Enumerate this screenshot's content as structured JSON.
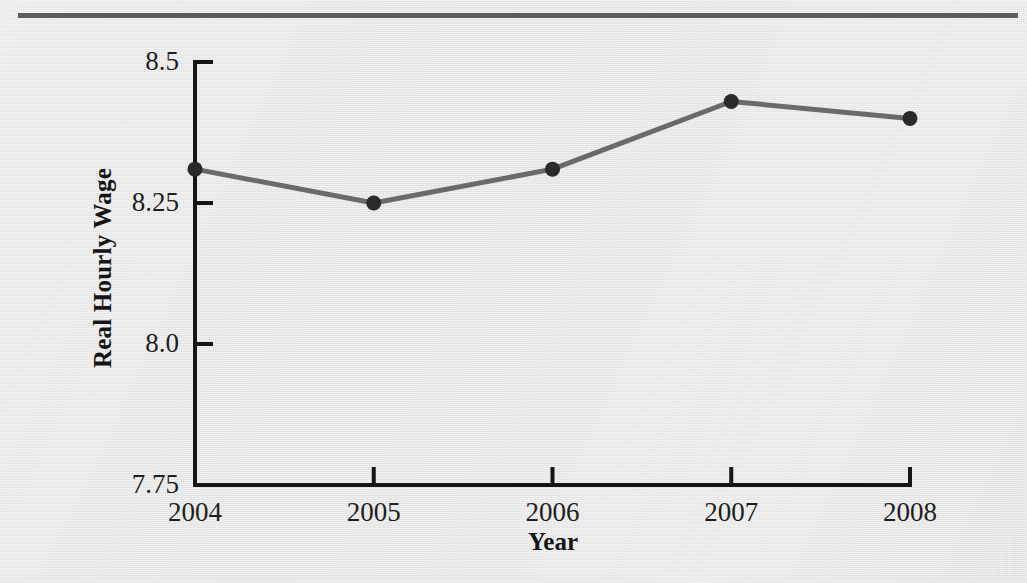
{
  "figure": {
    "top_rule_color": "#5c5c5c",
    "background_color": "#e8e8e8"
  },
  "chart_data": {
    "type": "line",
    "title": "",
    "subtitle": "",
    "xlabel": "Year",
    "ylabel": "Real Hourly Wage",
    "categories": [
      "2004",
      "2005",
      "2006",
      "2007",
      "2008"
    ],
    "x": [
      2004,
      2005,
      2006,
      2007,
      2008
    ],
    "values": [
      8.31,
      8.25,
      8.31,
      8.43,
      8.4
    ],
    "series": [
      {
        "name": "Real Hourly Wage",
        "values": [
          8.31,
          8.25,
          8.31,
          8.43,
          8.4
        ]
      }
    ],
    "ylim": [
      7.75,
      8.5
    ],
    "xlim": [
      2004,
      2008
    ],
    "ytick_labels": [
      "8.5",
      "8.25",
      "8.0",
      "7.75"
    ],
    "ytick_values": [
      8.5,
      8.25,
      8.0,
      7.75
    ],
    "xtick_labels": [
      "2004",
      "2005",
      "2006",
      "2007",
      "2008"
    ],
    "grid": false,
    "legend": false,
    "legend_position": "none",
    "line_color": "#6a6a6a",
    "marker_color": "#2a2a2a",
    "axis_color": "#151515",
    "marker": "circle",
    "annotations": []
  }
}
